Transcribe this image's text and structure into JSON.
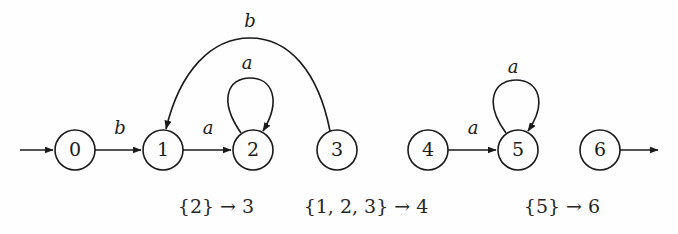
{
  "figure": {
    "name": "nfa-subset-construction-diagram",
    "background_color": "#fefefe",
    "ink_color": "#1a1a1a",
    "width": 678,
    "height": 234
  },
  "states": [
    {
      "id": "0",
      "label": "0",
      "cx": 75,
      "cy": 150,
      "r": 20
    },
    {
      "id": "1",
      "label": "1",
      "cx": 163,
      "cy": 150,
      "r": 20
    },
    {
      "id": "2",
      "label": "2",
      "cx": 253,
      "cy": 150,
      "r": 20
    },
    {
      "id": "3",
      "label": "3",
      "cx": 337,
      "cy": 150,
      "r": 20
    },
    {
      "id": "4",
      "label": "4",
      "cx": 428,
      "cy": 150,
      "r": 20
    },
    {
      "id": "5",
      "label": "5",
      "cx": 518,
      "cy": 150,
      "r": 20
    },
    {
      "id": "6",
      "label": "6",
      "cx": 600,
      "cy": 150,
      "r": 20
    }
  ],
  "edges": [
    {
      "id": "start-into-0",
      "from": "start",
      "to": "0",
      "label": "",
      "label_x": 0,
      "label_y": 0,
      "kind": "start-arrow"
    },
    {
      "id": "0-to-1",
      "from": "0",
      "to": "1",
      "label": "b",
      "label_x": 120,
      "label_y": 129,
      "kind": "straight"
    },
    {
      "id": "1-to-2",
      "from": "1",
      "to": "2",
      "label": "a",
      "label_x": 208,
      "label_y": 129,
      "kind": "straight"
    },
    {
      "id": "2-self-loop",
      "from": "2",
      "to": "2",
      "label": "a",
      "label_x": 247,
      "label_y": 64,
      "kind": "self-loop"
    },
    {
      "id": "3-to-1",
      "from": "3",
      "to": "1",
      "label": "b",
      "label_x": 250,
      "label_y": 22,
      "kind": "big-arc"
    },
    {
      "id": "4-to-5",
      "from": "4",
      "to": "5",
      "label": "a",
      "label_x": 473,
      "label_y": 129,
      "kind": "straight"
    },
    {
      "id": "5-self-loop",
      "from": "5",
      "to": "5",
      "label": "a",
      "label_x": 513,
      "label_y": 68,
      "kind": "self-loop"
    },
    {
      "id": "6-out-arrow",
      "from": "6",
      "to": "end",
      "label": "",
      "label_x": 0,
      "label_y": 0,
      "kind": "end-arrow"
    }
  ],
  "captions": [
    {
      "id": "caption-1",
      "text": "{2} → 3",
      "x": 216,
      "y": 208
    },
    {
      "id": "caption-2",
      "text": "{1, 2, 3} → 4",
      "x": 366,
      "y": 208
    },
    {
      "id": "caption-3",
      "text": "{5} → 6",
      "x": 562,
      "y": 208
    }
  ]
}
